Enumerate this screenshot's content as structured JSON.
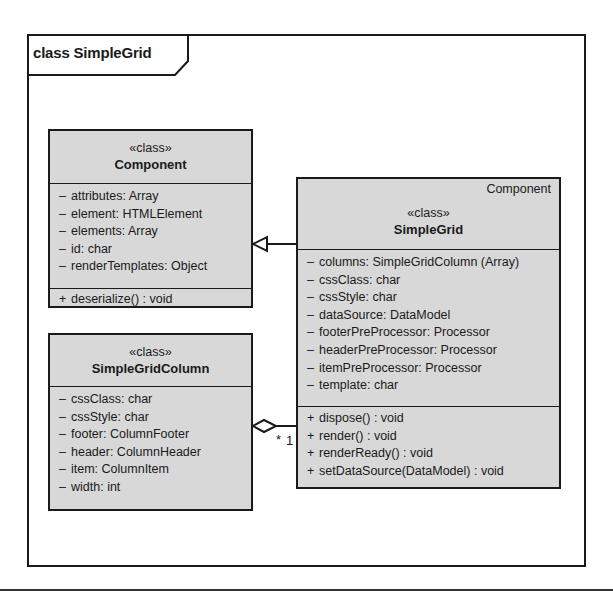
{
  "frame": {
    "title": "class SimpleGrid"
  },
  "classes": {
    "component": {
      "stereotype": "«class»",
      "name": "Component",
      "attributes": [
        {
          "vis": "–",
          "text": "attributes:  Array"
        },
        {
          "vis": "–",
          "text": "element:  HTMLElement"
        },
        {
          "vis": "–",
          "text": "elements:  Array"
        },
        {
          "vis": "–",
          "text": "id:  char"
        },
        {
          "vis": "–",
          "text": "renderTemplates:  Object"
        }
      ],
      "operations": [
        {
          "vis": "+",
          "text": "deserialize()  :  void"
        }
      ]
    },
    "simplegrid": {
      "parent": "Component",
      "stereotype": "«class»",
      "name": "SimpleGrid",
      "attributes": [
        {
          "vis": "–",
          "text": "columns:  SimpleGridColumn (Array)"
        },
        {
          "vis": "–",
          "text": "cssClass:  char"
        },
        {
          "vis": "–",
          "text": "cssStyle:  char"
        },
        {
          "vis": "–",
          "text": "dataSource:  DataModel"
        },
        {
          "vis": "–",
          "text": "footerPreProcessor:  Processor"
        },
        {
          "vis": "–",
          "text": "headerPreProcessor:  Processor"
        },
        {
          "vis": "–",
          "text": "itemPreProcessor:  Processor"
        },
        {
          "vis": "–",
          "text": "template:  char"
        }
      ],
      "operations": [
        {
          "vis": "+",
          "text": "dispose()  :  void"
        },
        {
          "vis": "+",
          "text": "render()  :  void"
        },
        {
          "vis": "+",
          "text": "renderReady()  :  void"
        },
        {
          "vis": "+",
          "text": "setDataSource(DataModel)  :  void"
        }
      ]
    },
    "simplegridcolumn": {
      "stereotype": "«class»",
      "name": "SimpleGridColumn",
      "attributes": [
        {
          "vis": "–",
          "text": "cssClass:  char"
        },
        {
          "vis": "–",
          "text": "cssStyle:  char"
        },
        {
          "vis": "–",
          "text": "footer:  ColumnFooter"
        },
        {
          "vis": "–",
          "text": "header:  ColumnHeader"
        },
        {
          "vis": "–",
          "text": "item:  ColumnItem"
        },
        {
          "vis": "–",
          "text": "width:  int"
        }
      ]
    }
  },
  "relations": {
    "generalization": {
      "from": "SimpleGrid",
      "to": "Component",
      "type": "generalization"
    },
    "aggregation": {
      "whole": "SimpleGrid",
      "part": "SimpleGridColumn",
      "type": "aggregation",
      "part_multiplicity": "*",
      "whole_multiplicity": "1"
    }
  },
  "colors": {
    "box_fill": "#d8d8d8",
    "line": "#1a1a1a",
    "background": "#ffffff"
  }
}
